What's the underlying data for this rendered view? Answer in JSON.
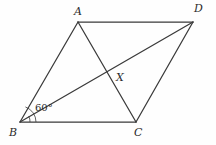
{
  "figure": {
    "type": "geometry-diagram",
    "shape": "parallelogram",
    "caption": "",
    "stroke_color": "#3a3a3a",
    "background_color": "#fefefe",
    "label_color": "#2b2b2b"
  },
  "vertices": {
    "A": {
      "label": "A",
      "x": 78,
      "y": 22,
      "label_x": 74,
      "label_y": 6
    },
    "B": {
      "label": "B",
      "x": 20,
      "y": 122,
      "label_x": 9,
      "label_y": 127
    },
    "C": {
      "label": "C",
      "x": 136,
      "y": 122,
      "label_x": 134,
      "label_y": 127
    },
    "D": {
      "label": "D",
      "x": 193,
      "y": 22,
      "label_x": 194,
      "label_y": 3
    },
    "X": {
      "label": "X",
      "x": 110,
      "y": 73,
      "label_x": 116,
      "label_y": 72
    }
  },
  "edges": [
    {
      "name": "AD",
      "from": "A",
      "to": "D"
    },
    {
      "name": "AB",
      "from": "A",
      "to": "B"
    },
    {
      "name": "BC",
      "from": "B",
      "to": "C"
    },
    {
      "name": "CD",
      "from": "C",
      "to": "D"
    }
  ],
  "diagonals": [
    {
      "name": "AC",
      "from": "A",
      "to": "C"
    },
    {
      "name": "BD",
      "from": "B",
      "to": "D"
    }
  ],
  "angles": [
    {
      "name": "angle-at-B",
      "label": "60°",
      "vertex": "B",
      "label_x": 35,
      "label_y": 103,
      "arc_radii": [
        10,
        16
      ]
    }
  ]
}
